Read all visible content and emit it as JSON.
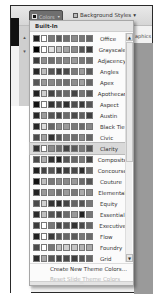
{
  "ribbon": {
    "colors_button_label": "Colors",
    "background_styles_label": "Background Styles",
    "background_styles_caret": "▾",
    "graphics_label": "aphics",
    "side_arrows": [
      "▴",
      "▾"
    ]
  },
  "menu": {
    "header": "Built-In",
    "hover_index": 11,
    "themes": [
      {
        "name": "Office",
        "colors": [
          "#1f1f1f",
          "#ffffff",
          "#7a7a7a",
          "#5a5a5a",
          "#6e6e6e",
          "#8a8a8a",
          "#777777",
          "#666666"
        ]
      },
      {
        "name": "Grayscale",
        "colors": [
          "#000000",
          "#ffffff",
          "#e0e0e0",
          "#bdbdbd",
          "#a3a3a3",
          "#8a8a8a",
          "#555555",
          "#3c3c3c"
        ]
      },
      {
        "name": "Adjacency",
        "colors": [
          "#3a3a3a",
          "#8f8f8f",
          "#6e6e6e",
          "#7c7c7c",
          "#888888",
          "#999999",
          "#777777",
          "#6a6a6a"
        ]
      },
      {
        "name": "Angles",
        "colors": [
          "#262626",
          "#bdbdbd",
          "#555555",
          "#3e3e3e",
          "#4a4a4a",
          "#7a7a7a",
          "#9a9a9a",
          "#5a5a5a"
        ]
      },
      {
        "name": "Apex",
        "colors": [
          "#555555",
          "#999999",
          "#888888",
          "#777777",
          "#6f6f6f",
          "#8e8e8e",
          "#a0a0a0",
          "#666666"
        ]
      },
      {
        "name": "Apothecary",
        "colors": [
          "#1f1f1f",
          "#d0d0d0",
          "#444444",
          "#5c5c5c",
          "#6a6a6a",
          "#444444",
          "#777777",
          "#555555"
        ]
      },
      {
        "name": "Aspect",
        "colors": [
          "#111111",
          "#ffffff",
          "#333333",
          "#444444",
          "#2e2e2e",
          "#4d4d4d",
          "#3a3a3a",
          "#555555"
        ]
      },
      {
        "name": "Austin",
        "colors": [
          "#262626",
          "#9a9a9a",
          "#555555",
          "#444444",
          "#6a6a6a",
          "#4a4a4a",
          "#5e5e5e",
          "#3f3f3f"
        ]
      },
      {
        "name": "Black Tie",
        "colors": [
          "#262626",
          "#dcdcdc",
          "#666666",
          "#8a8a8a",
          "#9a9a9a",
          "#7a7a7a",
          "#6a6a6a",
          "#888888"
        ]
      },
      {
        "name": "Civic",
        "colors": [
          "#4a4a4a",
          "#a0a0a0",
          "#333333",
          "#555555",
          "#777777",
          "#6e6e6e",
          "#888888",
          "#666666"
        ]
      },
      {
        "name": "Clarity",
        "colors": [
          "#333333",
          "#ffffff",
          "#8a8a8a",
          "#6a6a6a",
          "#444444",
          "#5a5a5a",
          "#7a7a7a",
          "#555555"
        ]
      },
      {
        "name": "Composite",
        "colors": [
          "#4a4a4a",
          "#ababab",
          "#333333",
          "#222222",
          "#555555",
          "#666666",
          "#777777",
          "#444444"
        ]
      },
      {
        "name": "Concourse",
        "colors": [
          "#1f1f1f",
          "#444444",
          "#555555",
          "#333333",
          "#3e3e3e",
          "#4a4a4a",
          "#2e2e2e",
          "#666666"
        ]
      },
      {
        "name": "Couture",
        "colors": [
          "#111111",
          "#bdbdbd",
          "#777777",
          "#888888",
          "#8a8a8a",
          "#999999",
          "#6a6a6a",
          "#555555"
        ]
      },
      {
        "name": "Elemental",
        "colors": [
          "#222222",
          "#999999",
          "#888888",
          "#6a6a6a",
          "#9a9a9a",
          "#7a7a7a",
          "#aaaaaa",
          "#888888"
        ]
      },
      {
        "name": "Equity",
        "colors": [
          "#4a4a4a",
          "#d0d0d0",
          "#333333",
          "#2a2a2a",
          "#444444",
          "#666666",
          "#555555",
          "#777777"
        ]
      },
      {
        "name": "Essential",
        "colors": [
          "#2a2a2a",
          "#bdbdbd",
          "#555555",
          "#444444",
          "#6a6a6a",
          "#9a9a9a",
          "#222222",
          "#777777"
        ]
      },
      {
        "name": "Executive",
        "colors": [
          "#3a3a3a",
          "#ffffff",
          "#777777",
          "#444444",
          "#555555",
          "#333333",
          "#4a4a4a",
          "#666666"
        ]
      },
      {
        "name": "Flow",
        "colors": [
          "#1f1f1f",
          "#ffffff",
          "#3a3a3a",
          "#555555",
          "#666666",
          "#5a5a5a",
          "#777777",
          "#6a6a6a"
        ]
      },
      {
        "name": "Foundry",
        "colors": [
          "#4a4a4a",
          "#ffffff",
          "#777777",
          "#bdbdbd",
          "#cfcfcf",
          "#c4c4c4",
          "#b5b5b5",
          "#aaaaaa"
        ]
      },
      {
        "name": "Grid",
        "colors": [
          "#2a2a2a",
          "#a8a8a8",
          "#555555",
          "#444444",
          "#4a4a4a",
          "#3e3e3e",
          "#555555",
          "#666666"
        ]
      }
    ],
    "footer": {
      "create": "Create New Theme Colors...",
      "reset": "Reset Slide Theme Colors"
    },
    "scroll": {
      "up": "▲",
      "down": "▼"
    },
    "grip": "····"
  }
}
